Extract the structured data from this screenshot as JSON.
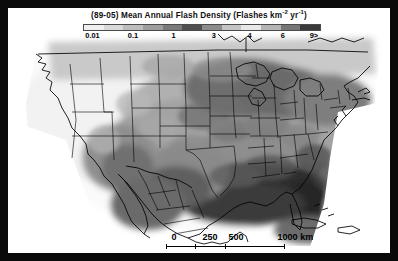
{
  "figure": {
    "width": 398,
    "height": 261,
    "frame_color": "#000000",
    "canvas_color": "#ffffff"
  },
  "legend": {
    "title_prefix": "(89-05) Mean Annual Flash Density (Flashes km",
    "title_exp1": "-2",
    "title_mid": " yr",
    "title_exp2": "-1",
    "title_suffix": ")",
    "title_full": "(89-05) Mean Annual Flash Density (Flashes km-2 yr-1)",
    "colorbar": {
      "orientation": "horizontal",
      "segments": [
        {
          "label": "0.01",
          "color": "#f0f0f0"
        },
        {
          "label": "0.1",
          "color": "#d9d9d9"
        },
        {
          "label": "0.3",
          "color": "#bdbdbd"
        },
        {
          "label": "1",
          "color": "#9e9e9e"
        },
        {
          "label": "2",
          "color": "#7a7a7a"
        },
        {
          "label": "3",
          "color": "#4f4f4f"
        },
        {
          "label": "4",
          "color": "#8c8c8c"
        },
        {
          "label": "5",
          "color": "#c4c4c4"
        },
        {
          "label": "6",
          "color": "#e8e8e8"
        },
        {
          "label": "7",
          "color": "#b5b5b5"
        },
        {
          "label": "8",
          "color": "#767676"
        },
        {
          "label": "9>",
          "color": "#3a3a3a"
        }
      ],
      "ticks": [
        {
          "label": "0.01",
          "pos_pct": 4
        },
        {
          "label": "0.1",
          "pos_pct": 21
        },
        {
          "label": "1",
          "pos_pct": 38
        },
        {
          "label": "3",
          "pos_pct": 55
        },
        {
          "label": "4",
          "pos_pct": 70
        },
        {
          "label": "6",
          "pos_pct": 84
        },
        {
          "label": "9>",
          "pos_pct": 97
        }
      ]
    }
  },
  "scalebar": {
    "unit": "km",
    "labels": [
      {
        "text": "0",
        "pos_px": 8
      },
      {
        "text": "250",
        "pos_px": 44
      },
      {
        "text": "500",
        "pos_px": 70
      },
      {
        "text": "1000 km",
        "pos_px": 118
      }
    ],
    "ticks_px": [
      0,
      29,
      59,
      118
    ]
  },
  "chart_data": {
    "type": "heatmap",
    "title": "(89-05) Mean Annual Flash Density (Flashes km-2 yr-1)",
    "subtitle": "",
    "xlabel": "",
    "ylabel": "",
    "colormap": "grayscale-banded",
    "legend_position": "top",
    "grid": false,
    "region": "Continental United States, southern Canada, Mexico, Caribbean",
    "variable": "Mean annual lightning flash density",
    "units": "flashes km-2 yr-1",
    "period": "1989-2005",
    "value_breaks": [
      0.01,
      0.1,
      1,
      3,
      4,
      6,
      9
    ],
    "scale_bar_km": [
      0,
      250,
      500,
      1000
    ],
    "regional_values": [
      {
        "region": "Pacific Northwest coast",
        "value": 0.1
      },
      {
        "region": "California coast",
        "value": 0.01
      },
      {
        "region": "Great Basin / Nevada",
        "value": 1
      },
      {
        "region": "Arizona / New Mexico",
        "value": 4
      },
      {
        "region": "Northern Rockies",
        "value": 1
      },
      {
        "region": "Northern Plains",
        "value": 3
      },
      {
        "region": "Central Plains / Kansas",
        "value": 6
      },
      {
        "region": "Texas Gulf Coast",
        "value": 9
      },
      {
        "region": "Louisiana / Mississippi",
        "value": 9
      },
      {
        "region": "Florida peninsula",
        "value": 9
      },
      {
        "region": "Southeast Atlantic coast",
        "value": 9
      },
      {
        "region": "Ohio Valley",
        "value": 4
      },
      {
        "region": "Great Lakes",
        "value": 3
      },
      {
        "region": "Northeast / New England",
        "value": 3
      },
      {
        "region": "Southern Canada",
        "value": 1
      },
      {
        "region": "Gulf of Mexico waters",
        "value": 9
      },
      {
        "region": "Caribbean / Cuba",
        "value": 6
      }
    ]
  }
}
